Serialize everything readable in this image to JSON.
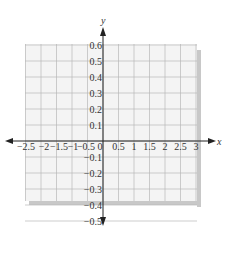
{
  "chart_data": {
    "type": "line",
    "title": "",
    "xlabel": "x",
    "ylabel": "y",
    "xlim": [
      -2.5,
      3
    ],
    "ylim": [
      -0.5,
      0.6
    ],
    "grid": true,
    "x_ticks": [
      "-2.5",
      "-2",
      "-1.5",
      "-1",
      "-0.5",
      "0",
      "0.5",
      "1",
      "1.5",
      "2",
      "2.5",
      "3"
    ],
    "y_ticks": [
      "0.6",
      "0.5",
      "0.4",
      "0.3",
      "0.2",
      "0.1",
      "-0.1",
      "-0.2",
      "-0.3",
      "-0.4",
      "-0.5"
    ],
    "series": [],
    "legend": null
  },
  "labels": {
    "x_axis": "x",
    "y_axis": "y"
  },
  "colors": {
    "grid_bg": "#f4f4f4",
    "grid_line": "#b8b8b8",
    "shadow": "#c8c8c8",
    "axis": "#222222",
    "text": "#333333"
  }
}
